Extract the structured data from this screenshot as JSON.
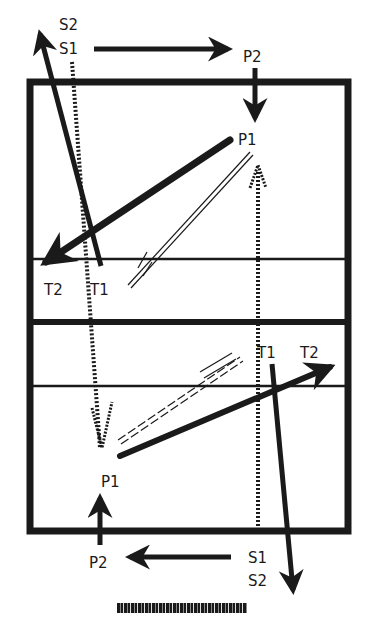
{
  "diagram": {
    "type": "volleyball rotation / movement diagram",
    "colors": {
      "ink": "#1a1a1a",
      "background": "#ffffff"
    },
    "court": {
      "outline": {
        "x": 28,
        "y": 80,
        "width": 322,
        "height": 453
      },
      "net_line_y": 322,
      "attack_line_top_y": 258,
      "attack_line_bottom_y": 385
    },
    "top_half": {
      "labels": {
        "s2": "S2",
        "s1": "S1",
        "p2": "P2",
        "p1": "P1",
        "t2": "T2",
        "t1": "T1"
      }
    },
    "bottom_half": {
      "labels": {
        "t1": "T1",
        "t2": "T2",
        "p1": "P1",
        "p2": "P2",
        "s1": "S1",
        "s2": "S2"
      }
    },
    "arrow_styles": {
      "solid": "player movement",
      "hatched": "ball path (set/serve)",
      "double_line": "ball path (pass)"
    },
    "caption": "illegible scanned caption strip"
  }
}
